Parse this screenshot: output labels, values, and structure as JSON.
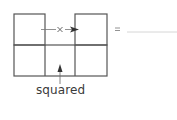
{
  "diagram": {
    "type": "grid-shape",
    "grid": {
      "columns": 3,
      "rows": 2,
      "filled_cells": [
        [
          0,
          0
        ],
        [
          0,
          2
        ],
        [
          1,
          0
        ],
        [
          1,
          1
        ],
        [
          1,
          2
        ]
      ],
      "open_cells": [
        [
          0,
          1
        ]
      ]
    },
    "arrow_label": "x",
    "squared_label": "squared",
    "equals_sign": "=",
    "answer_blank": "",
    "colors": {
      "line": "#555555",
      "arrow": "#333333",
      "text": "#3a3a3a"
    }
  }
}
